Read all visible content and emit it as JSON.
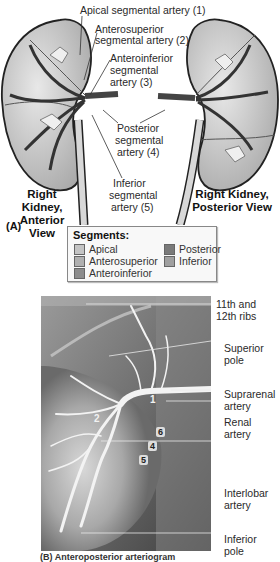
{
  "panel_a": {
    "tag": "(A)",
    "labels": {
      "apical": "Apical segmental artery (1)",
      "anterosuperior_1": "Anterosuperior",
      "anterosuperior_2": "segmental artery (2)",
      "anteroinferior_1": "Anteroinferior",
      "anteroinferior_2": "segmental",
      "anteroinferior_3": "artery (3)",
      "posterior_1": "Posterior",
      "posterior_2": "segmental",
      "posterior_3": "artery (4)",
      "inferior_1": "Inferior",
      "inferior_2": "segmental",
      "inferior_3": "artery (5)"
    },
    "views": {
      "anterior_1": "Right Kidney,",
      "anterior_2": "Anterior View",
      "posterior_1": "Right Kidney,",
      "posterior_2": "Posterior View"
    }
  },
  "legend": {
    "title": "Segments:",
    "items": [
      {
        "label": "Apical",
        "color": "#c4c4c4"
      },
      {
        "label": "Anterosuperior",
        "color": "#b0b0b0"
      },
      {
        "label": "Anteroinferior",
        "color": "#8c8c8c"
      },
      {
        "label": "Posterior",
        "color": "#7a7a7a"
      },
      {
        "label": "Inferior",
        "color": "#a0a0a0"
      }
    ]
  },
  "panel_b": {
    "labels": {
      "ribs_1": "11th and",
      "ribs_2": "12th ribs",
      "superior_pole_1": "Superior",
      "superior_pole_2": "pole",
      "suprarenal_1": "Suprarenal",
      "suprarenal_2": "artery",
      "renal_1": "Renal",
      "renal_2": "artery",
      "interlobar_1": "Interlobar",
      "interlobar_2": "artery",
      "inferior_pole_1": "Inferior",
      "inferior_pole_2": "pole"
    },
    "numbers": [
      "1",
      "2",
      "6",
      "4",
      "5"
    ],
    "caption": "(B) Anteroposterior arteriogram"
  }
}
